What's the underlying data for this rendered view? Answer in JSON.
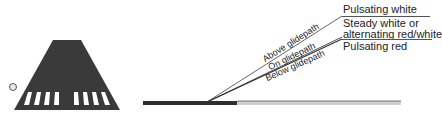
{
  "figure": {
    "runway_view": {
      "shape": "runway-trapezoid",
      "threshold_stripes_left": 4,
      "threshold_stripes_right": 4,
      "indicator_light": "light-circle"
    },
    "glidepath_lines": [
      {
        "label": "Above glidepath",
        "signal": "Pulsating white"
      },
      {
        "label": "On glidepath",
        "signal_line1": "Steady white or",
        "signal_line2": "alternating red/white"
      },
      {
        "label": "Below glidepath",
        "signal": "Pulsating red"
      }
    ]
  },
  "colors": {
    "runway": "#3a3a3a",
    "stripes": "#ffffff",
    "ground_dark": "#2e2e2e",
    "ground_light": "#cfcfcf",
    "lines": "#444444"
  }
}
